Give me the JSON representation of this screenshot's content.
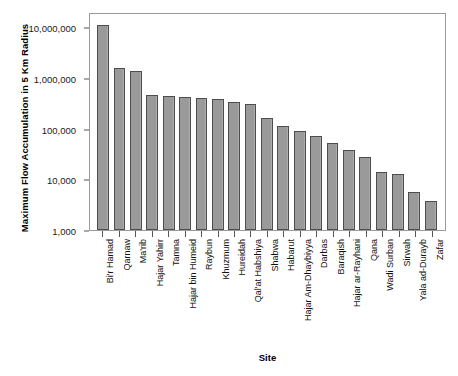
{
  "chart_data": {
    "type": "bar",
    "title": "",
    "xlabel": "Site",
    "ylabel": "Maximum Flow Accumulation in 5 Km Radius",
    "yscale": "log",
    "ylim": [
      1000,
      20000000
    ],
    "ytick_labels": [
      "10,000,000",
      "1,000,000",
      "100,000",
      "10,000",
      "1,000"
    ],
    "ytick_values": [
      10000000,
      1000000,
      100000,
      10000,
      1000
    ],
    "grid": false,
    "legend": null,
    "bar_color": "#9a9a9a",
    "bar_edge_color": "#4d4d4d",
    "categories": [
      "Bi'r Hamad",
      "Qarnaw",
      "Ma'rib",
      "Hajar Yahirr",
      "Tamna",
      "Hajar bin Humeid",
      "Raybun",
      "Khuzmum",
      "Hureidah",
      "Qal'at Habshiya",
      "Shabwa",
      "Habarut",
      "Hajar Am-Dhaybiyya",
      "Darbas",
      "Baraqish",
      "Hajar ar-Rayhani",
      "Qana",
      "Wadi Surban",
      "Sirwah",
      "Yala ad-Durayb",
      "Zafar"
    ],
    "values": [
      11000000,
      1550000,
      1400000,
      470000,
      440000,
      420000,
      410000,
      390000,
      340000,
      310000,
      160000,
      115000,
      88000,
      72000,
      52000,
      38000,
      28000,
      14000,
      13000,
      5500,
      3800
    ]
  }
}
